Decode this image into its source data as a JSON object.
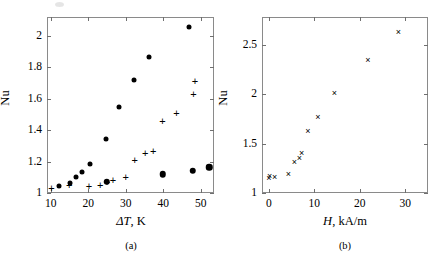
{
  "figure": {
    "panels": [
      {
        "id": "a",
        "caption": "(a)",
        "xlabel_symbol": "ΔT",
        "xlabel_rest": ", K",
        "ylabel": "Nu",
        "xticks": [
          10,
          20,
          30,
          40,
          50
        ],
        "yticks": [
          "1",
          "1.2",
          "1.4",
          "1.6",
          "1.8",
          "2"
        ]
      },
      {
        "id": "b",
        "caption": "(b)",
        "xlabel_symbol": "H",
        "xlabel_rest": ", kA/m",
        "ylabel": "Nu",
        "xticks": [
          0,
          10,
          20,
          30
        ],
        "yticks": [
          "1",
          "1.5",
          "2",
          "2.5"
        ]
      }
    ]
  },
  "chart_data": [
    {
      "type": "scatter",
      "panel": "(a)",
      "title": "",
      "xlabel": "ΔT, K",
      "ylabel": "Nu",
      "xlim": [
        9,
        53.5
      ],
      "ylim": [
        1.0,
        2.12
      ],
      "xticks": [
        10,
        20,
        30,
        40,
        50
      ],
      "yticks": [
        1,
        1.2,
        1.4,
        1.6,
        1.8,
        2
      ],
      "grid": false,
      "legend": null,
      "series": [
        {
          "name": "filled-circle-upper-branch",
          "marker": "filled circle",
          "color": "#000000",
          "points": [
            {
              "x": 12.2,
              "y": 1.046
            },
            {
              "x": 15.0,
              "y": 1.066
            },
            {
              "x": 16.7,
              "y": 1.105
            },
            {
              "x": 18.2,
              "y": 1.131
            },
            {
              "x": 20.4,
              "y": 1.183
            },
            {
              "x": 24.8,
              "y": 1.345
            },
            {
              "x": 28.2,
              "y": 1.548
            },
            {
              "x": 32.3,
              "y": 1.718
            },
            {
              "x": 36.2,
              "y": 1.868
            },
            {
              "x": 46.8,
              "y": 2.058
            }
          ]
        },
        {
          "name": "filled-circle-lower-branch",
          "marker": "filled circle (large)",
          "color": "#000000",
          "points": [
            {
              "x": 24.9,
              "y": 1.071
            },
            {
              "x": 39.9,
              "y": 1.118
            },
            {
              "x": 47.9,
              "y": 1.143
            },
            {
              "x": 52.3,
              "y": 1.163
            }
          ]
        },
        {
          "name": "plus-marker-series",
          "marker": "plus",
          "color": "#000000",
          "points": [
            {
              "x": 10.2,
              "y": 1.031
            },
            {
              "x": 14.9,
              "y": 1.052
            },
            {
              "x": 20.2,
              "y": 1.046
            },
            {
              "x": 23.2,
              "y": 1.051
            },
            {
              "x": 25.0,
              "y": 1.068
            },
            {
              "x": 26.6,
              "y": 1.081
            },
            {
              "x": 30.0,
              "y": 1.103
            },
            {
              "x": 32.4,
              "y": 1.21
            },
            {
              "x": 35.2,
              "y": 1.257
            },
            {
              "x": 37.3,
              "y": 1.268
            },
            {
              "x": 39.8,
              "y": 1.458
            },
            {
              "x": 43.5,
              "y": 1.512
            },
            {
              "x": 48.0,
              "y": 1.632
            },
            {
              "x": 48.4,
              "y": 1.71
            }
          ]
        }
      ]
    },
    {
      "type": "scatter",
      "panel": "(b)",
      "title": "",
      "xlabel": "H, kA/m",
      "ylabel": "Nu",
      "xlim": [
        -1.5,
        35
      ],
      "ylim": [
        1.0,
        2.78
      ],
      "xticks": [
        0,
        10,
        20,
        30
      ],
      "yticks": [
        1,
        1.5,
        2,
        2.5
      ],
      "grid": false,
      "legend": null,
      "series": [
        {
          "name": "cross-marker-series",
          "marker": "cross (x)",
          "color": "#000000",
          "points": [
            {
              "x": 0.0,
              "y": 1.152
            },
            {
              "x": 0.2,
              "y": 1.168
            },
            {
              "x": 1.3,
              "y": 1.165
            },
            {
              "x": 4.3,
              "y": 1.19
            },
            {
              "x": 5.6,
              "y": 1.312
            },
            {
              "x": 6.7,
              "y": 1.352
            },
            {
              "x": 7.2,
              "y": 1.405
            },
            {
              "x": 8.6,
              "y": 1.622
            },
            {
              "x": 10.8,
              "y": 1.765
            },
            {
              "x": 14.4,
              "y": 2.008
            },
            {
              "x": 21.8,
              "y": 2.35
            },
            {
              "x": 28.5,
              "y": 2.628
            }
          ]
        }
      ]
    }
  ]
}
